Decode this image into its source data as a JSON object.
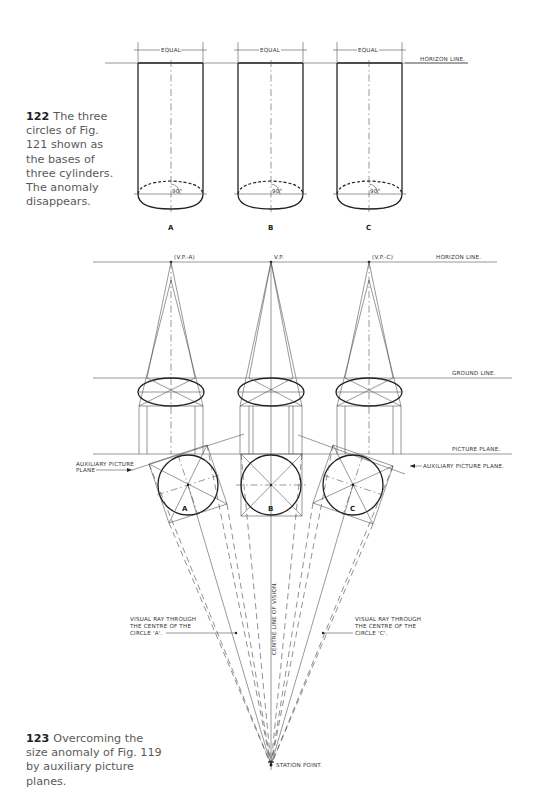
{
  "figure_122": {
    "caption_number": "122",
    "caption_text": "The three circles of Fig. 121 shown as the bases of three cylinders. The anomaly disappears.",
    "dimension_label": "EQUAL",
    "horizon_label": "HORIZON  LINE.",
    "angle_label": "90°",
    "cylinders": [
      {
        "label": "A",
        "cx": 171
      },
      {
        "label": "B",
        "cx": 271
      },
      {
        "label": "C",
        "cx": 369
      }
    ]
  },
  "figure_123": {
    "caption_number": "123",
    "caption_text": "Overcoming the size anomaly of Fig. 119 by auxiliary picture planes.",
    "horizon_label": "HORIZON  LINE.",
    "ground_label": "GROUND  LINE.",
    "picture_plane_label": "PICTURE  PLANE.",
    "aux_plane_left_label_1": "AUXILIARY  PICTURE",
    "aux_plane_left_label_2": "PLANE",
    "aux_plane_right_label": "AUXILIARY  PICTURE  PLANE.",
    "vp_a": "(V.P.-A)",
    "vp": "V.P.",
    "vp_c": "(V.P.-C)",
    "centre_line_label": "CENTRE  LINE  OF  VISION.",
    "ray_a_lines": [
      "VISUAL  RAY  THROUGH",
      "THE  CENTRE  OF  THE",
      "CIRCLE  'A'."
    ],
    "ray_c_lines": [
      "VISUAL  RAY  THROUGH",
      "THE  CENTRE  OF  THE",
      "CIRCLE  'C'."
    ],
    "station_point_label": "STATION  POINT.",
    "circles": [
      {
        "label": "A"
      },
      {
        "label": "B"
      },
      {
        "label": "C"
      }
    ]
  }
}
